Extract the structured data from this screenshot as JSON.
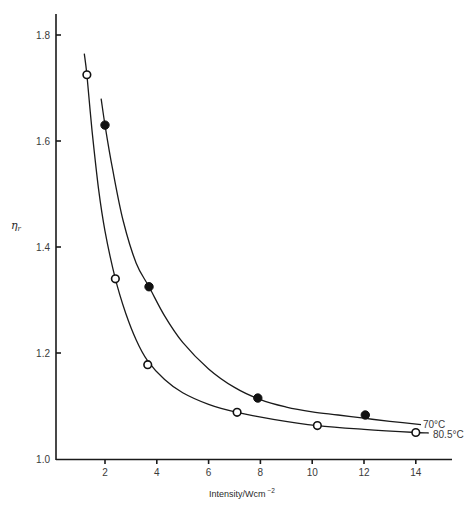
{
  "chart_data": {
    "type": "line",
    "title": "",
    "xlabel": "Intensity/Wcm",
    "xlabel_superscript": "−2",
    "ylabel": "η",
    "ylabel_subscript": "r",
    "xlim": [
      0,
      15
    ],
    "ylim": [
      1.0,
      1.85
    ],
    "x_ticks": [
      2,
      4,
      6,
      8,
      10,
      12,
      14
    ],
    "x_tick_labels": [
      "2",
      "4",
      "6",
      "8",
      "10",
      "12",
      "14"
    ],
    "y_ticks": [
      1.0,
      1.2,
      1.4,
      1.6,
      1.8
    ],
    "y_tick_labels": [
      "1.0",
      "1.2",
      "1.4",
      "1.6",
      "1.8"
    ],
    "grid": false,
    "legend": "inline labels at curve ends",
    "series": [
      {
        "name": "70°C",
        "marker": "filled-circle",
        "points": [
          {
            "x": 2.0,
            "y": 1.63
          },
          {
            "x": 3.7,
            "y": 1.325
          },
          {
            "x": 7.9,
            "y": 1.115
          },
          {
            "x": 12.05,
            "y": 1.083
          }
        ],
        "curve": [
          [
            1.85,
            1.68
          ],
          [
            2.0,
            1.63
          ],
          [
            2.3,
            1.545
          ],
          [
            2.7,
            1.45
          ],
          [
            3.2,
            1.37
          ],
          [
            3.7,
            1.325
          ],
          [
            4.3,
            1.27
          ],
          [
            5.0,
            1.22
          ],
          [
            6.0,
            1.17
          ],
          [
            7.0,
            1.135
          ],
          [
            8.0,
            1.112
          ],
          [
            9.0,
            1.098
          ],
          [
            10.0,
            1.089
          ],
          [
            11.0,
            1.083
          ],
          [
            12.0,
            1.077
          ],
          [
            13.0,
            1.071
          ],
          [
            14.2,
            1.065
          ]
        ]
      },
      {
        "name": "80.5°C",
        "marker": "open-circle",
        "points": [
          {
            "x": 1.3,
            "y": 1.725
          },
          {
            "x": 2.4,
            "y": 1.34
          },
          {
            "x": 3.65,
            "y": 1.178
          },
          {
            "x": 7.1,
            "y": 1.088
          },
          {
            "x": 10.2,
            "y": 1.063
          },
          {
            "x": 14.0,
            "y": 1.05
          }
        ],
        "curve": [
          [
            1.2,
            1.765
          ],
          [
            1.3,
            1.725
          ],
          [
            1.5,
            1.62
          ],
          [
            1.75,
            1.51
          ],
          [
            2.0,
            1.43
          ],
          [
            2.4,
            1.34
          ],
          [
            2.8,
            1.275
          ],
          [
            3.2,
            1.225
          ],
          [
            3.65,
            1.185
          ],
          [
            4.3,
            1.15
          ],
          [
            5.0,
            1.125
          ],
          [
            6.0,
            1.103
          ],
          [
            7.1,
            1.088
          ],
          [
            8.5,
            1.075
          ],
          [
            10.2,
            1.063
          ],
          [
            12.0,
            1.056
          ],
          [
            14.0,
            1.05
          ],
          [
            14.5,
            1.049
          ]
        ]
      }
    ]
  },
  "labels": {
    "series_70": "70°C",
    "series_805": "80.5°C",
    "xaxis_title": "Intensity/Wcm",
    "xaxis_title_sup": "−2",
    "yaxis_title": "η",
    "yaxis_title_sub": "r"
  }
}
